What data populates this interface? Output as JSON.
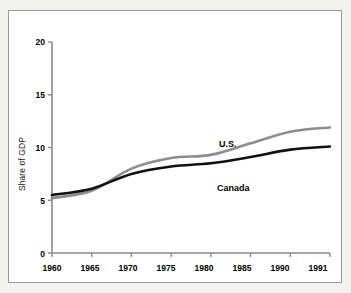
{
  "chart_data": {
    "type": "line",
    "title": "",
    "subtitle": "",
    "xlabel": "",
    "ylabel": "Share of GDP",
    "xlim": [
      1960,
      1991
    ],
    "ylim": [
      0,
      20
    ],
    "grid": false,
    "legend_position": "inline-annotation",
    "x_tick_labels": [
      "1960",
      "1965",
      "1970",
      "1975",
      "1980",
      "1985",
      "1990",
      "1991"
    ],
    "y_tick_labels": [
      "0",
      "5",
      "10",
      "15",
      "20"
    ],
    "x": [
      1960,
      1965,
      1970,
      1975,
      1980,
      1985,
      1990,
      1991
    ],
    "series": [
      {
        "name": "U.S.",
        "color": "#8c8c8c",
        "values": [
          5.2,
          5.9,
          8.0,
          9.0,
          9.3,
          10.4,
          11.5,
          11.9
        ],
        "annotation": {
          "text": "U.S.",
          "x_px": 210,
          "y_px": 128
        }
      },
      {
        "name": "Canada",
        "color": "#111111",
        "values": [
          5.5,
          6.1,
          7.5,
          8.2,
          8.5,
          9.1,
          9.8,
          10.1
        ],
        "annotation": {
          "text": "Canada",
          "x_px": 208,
          "y_px": 172
        }
      }
    ]
  },
  "axes": {
    "y_title": "Share of GDP",
    "y_ticks": [
      {
        "label": "20",
        "value": 20
      },
      {
        "label": "15",
        "value": 15
      },
      {
        "label": "10",
        "value": 10
      },
      {
        "label": "5",
        "value": 5
      },
      {
        "label": "0",
        "value": 0
      }
    ],
    "x_ticks": [
      {
        "label": "1960"
      },
      {
        "label": "1965"
      },
      {
        "label": "1970"
      },
      {
        "label": "1975"
      },
      {
        "label": "1980"
      },
      {
        "label": "1985"
      },
      {
        "label": "1990"
      },
      {
        "label": "1991"
      }
    ]
  },
  "annotations": {
    "us_label": "U.S.",
    "canada_label": "Canada"
  },
  "colors": {
    "us_line": "#8c8c8c",
    "canada_line": "#111111",
    "axis": "#8a8a8a",
    "frame": "#9a9a9a",
    "page_background": "#f2f2f0",
    "plot_background": "#ffffff"
  }
}
